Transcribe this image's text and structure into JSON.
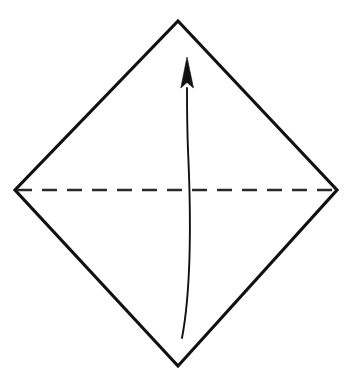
{
  "diagram": {
    "title": "Origami fold step diagram",
    "type": "origami-fold-instruction",
    "background_color": "#ffffff",
    "canvas": {
      "width": 346,
      "height": 385
    },
    "shape": {
      "name": "diamond",
      "description": "Square paper rotated 45 degrees shown as a diamond",
      "stroke_color": "#111111",
      "stroke_width": 3.2,
      "fill_color": "#ffffff",
      "vertices": {
        "top": {
          "x": 178,
          "y": 21
        },
        "right": {
          "x": 337,
          "y": 190
        },
        "bottom": {
          "x": 178,
          "y": 366
        },
        "left": {
          "x": 15,
          "y": 190
        }
      },
      "points_path": "178,21 337,190 178,366 15,190"
    },
    "crease": {
      "name": "horizontal-valley-fold-line",
      "style": "dashed",
      "stroke_color": "#2a2a2a",
      "stroke_width": 2.3,
      "dash_length": 15,
      "gap_length": 10,
      "dasharray": "15 10",
      "start": {
        "x": 17,
        "y": 190
      },
      "end": {
        "x": 335,
        "y": 190
      }
    },
    "arrow": {
      "name": "fold-direction-arrow",
      "direction": "upward",
      "meaning": "Fold the bottom point up to the top point",
      "stroke_color": "#111111",
      "stroke_width": 1.9,
      "shaft_path": "M 182,338 C 192,285 191,215 188,150 C 187,125 187,105 187,88",
      "tail": {
        "x": 182,
        "y": 338
      },
      "tip": {
        "x": 187,
        "y": 57
      },
      "head": {
        "style": "concave-barbed",
        "length": 30,
        "half_width": 5.5,
        "path": "M 187,57 L 193.5,88 L 187,82.5 L 180.8,88 Z"
      }
    }
  }
}
